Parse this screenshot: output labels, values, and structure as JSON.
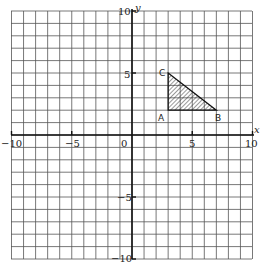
{
  "chart_data": {
    "type": "diagram",
    "title": "",
    "xlabel": "x",
    "ylabel": "y",
    "xlim": [
      -10,
      10
    ],
    "ylim": [
      -10,
      10
    ],
    "grid": true,
    "grid_step": 1,
    "x_ticks": [
      -10,
      -5,
      0,
      5,
      10
    ],
    "y_ticks": [
      10,
      5,
      -5,
      -10
    ],
    "x_tick_labels": [
      "−10",
      "−5",
      "0",
      "5",
      "10"
    ],
    "y_tick_labels": [
      "10",
      "5",
      "−5",
      "−10"
    ],
    "shapes": [
      {
        "type": "triangle",
        "fill": "hatched",
        "vertices": [
          {
            "label": "A",
            "x": 3,
            "y": 2
          },
          {
            "label": "B",
            "x": 7,
            "y": 2
          },
          {
            "label": "C",
            "x": 3,
            "y": 5
          }
        ]
      }
    ]
  },
  "labels": {
    "x_axis": "x",
    "y_axis": "y",
    "origin": "0",
    "x_neg10": "−10",
    "x_neg5": "−5",
    "x_5": "5",
    "x_10": "10",
    "y_10": "10",
    "y_5": "5",
    "y_neg5": "−5",
    "y_neg10": "−10",
    "point_a": "A",
    "point_b": "B",
    "point_c": "C"
  },
  "colors": {
    "grid": "#555555",
    "axis": "#111111",
    "hatch": "#333333",
    "background": "#ffffff"
  }
}
